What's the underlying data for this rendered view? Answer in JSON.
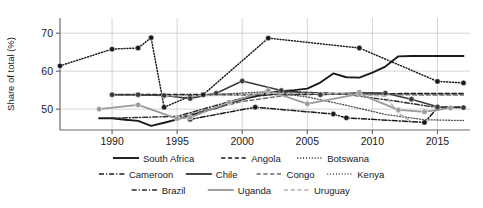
{
  "chart_data": {
    "type": "line",
    "title": "",
    "xlabel": "",
    "ylabel": "Share of total (%)",
    "xlim": [
      1986,
      2017.5
    ],
    "ylim": [
      44.5,
      74
    ],
    "xticks": [
      1990,
      1995,
      2000,
      2005,
      2010,
      2015
    ],
    "yticks": [
      50,
      60,
      70
    ],
    "xtick_labels": [
      "1990",
      "1995",
      "2000",
      "2005",
      "2010",
      "2015"
    ],
    "ytick_labels": [
      "70",
      "60",
      "50"
    ],
    "grid": "horizontal-and-vertical-light",
    "legend_position": "below-axes",
    "series": [
      {
        "name": "South Africa",
        "style": "solid",
        "color": "#1a1a1a",
        "width": 1.9,
        "markers": false,
        "x": [
          1989,
          1990,
          1991,
          1992,
          1993,
          1994,
          1995,
          1996,
          1997,
          1998,
          1999,
          2000,
          2001,
          2002,
          2003,
          2004,
          2005,
          2006,
          2007,
          2008,
          2009,
          2010,
          2011,
          2012,
          2013,
          2014,
          2015,
          2016,
          2017
        ],
        "values": [
          47.6,
          47.6,
          47.2,
          46.9,
          45.6,
          46.4,
          47.3,
          48.3,
          49.4,
          50.3,
          51.5,
          52.6,
          53.4,
          54.3,
          54.7,
          55.0,
          55.4,
          57.0,
          59.4,
          58.4,
          58.3,
          59.6,
          61.2,
          63.9,
          64.0,
          64.0,
          64.0,
          64.0,
          64.0
        ]
      },
      {
        "name": "Angola",
        "style": "dashed",
        "color": "#1a1a1a",
        "width": 1.7,
        "markers": false,
        "x": [
          1990,
          1995,
          2000,
          2005,
          2010,
          2014,
          2017
        ],
        "values": [
          53.8,
          53.8,
          53.8,
          53.9,
          54.0,
          54.1,
          54.1
        ]
      },
      {
        "name": "Botswana",
        "style": "dotted",
        "color": "#1a1a1a",
        "width": 1.5,
        "markers": true,
        "x": [
          1986,
          1990,
          1992,
          1993,
          1994,
          1996,
          1997,
          2002,
          2009,
          2015,
          2017
        ],
        "values": [
          61.4,
          65.8,
          66.1,
          68.8,
          50.5,
          53.4,
          53.8,
          68.7,
          66.1,
          57.3,
          56.9
        ]
      },
      {
        "name": "Cameroon",
        "style": "dashdot",
        "color": "#1a1a1a",
        "width": 1.5,
        "markers": true,
        "x": [
          1996,
          2001,
          2007,
          2008,
          2014,
          2015
        ],
        "values": [
          47.3,
          50.5,
          48.7,
          47.7,
          46.5,
          50.3
        ]
      },
      {
        "name": "Chile",
        "style": "solid",
        "color": "#3a3a3a",
        "width": 1.6,
        "markers": true,
        "x": [
          1990,
          1992,
          1994,
          1996,
          1998,
          2000,
          2003,
          2006,
          2009,
          2011,
          2013,
          2015,
          2017
        ],
        "values": [
          53.8,
          53.8,
          53.6,
          52.8,
          54.2,
          57.4,
          54.9,
          53.8,
          54.3,
          54.2,
          52.6,
          50.6,
          50.4
        ]
      },
      {
        "name": "Congo",
        "style": "dashed",
        "color": "#6a6a6a",
        "width": 1.4,
        "markers": false,
        "x": [
          1995,
          2000,
          2005,
          2010,
          2014,
          2017
        ],
        "values": [
          47.8,
          52.0,
          54.4,
          53.9,
          53.7,
          53.7
        ]
      },
      {
        "name": "Kenya",
        "style": "dotted",
        "color": "#4a4a4a",
        "width": 1.3,
        "markers": false,
        "x": [
          1992,
          1997,
          2002,
          2005,
          2008,
          2011,
          2014,
          2017
        ],
        "values": [
          53.6,
          53.7,
          54.6,
          53.2,
          51.0,
          48.6,
          47.2,
          47.0
        ]
      },
      {
        "name": "Brazil",
        "style": "dashdot",
        "color": "#2a2a2a",
        "width": 1.4,
        "markers": false,
        "x": [
          1990,
          1995,
          2000,
          2004,
          2008,
          2012,
          2015,
          2017
        ],
        "values": [
          47.6,
          48.1,
          52.9,
          54.6,
          53.9,
          52.0,
          50.4,
          50.6
        ]
      },
      {
        "name": "Uganda",
        "style": "solid",
        "color": "#9a9a9a",
        "width": 1.8,
        "markers": true,
        "x": [
          1989,
          1992,
          1995,
          1996,
          1999,
          2002,
          2005,
          2009,
          2012,
          2014,
          2016
        ],
        "values": [
          50.0,
          51.1,
          47.5,
          47.8,
          51.8,
          54.9,
          51.4,
          54.0,
          49.8,
          49.3,
          50.3
        ]
      },
      {
        "name": "Uruguay",
        "style": "dashed",
        "color": "#b0b0b0",
        "width": 1.4,
        "markers": false,
        "x": [
          1994,
          1998,
          2003,
          2008,
          2011,
          2012,
          2013
        ],
        "values": [
          53.5,
          53.6,
          54.2,
          54.0,
          53.4,
          49.0,
          46.6
        ]
      }
    ]
  },
  "axes": {
    "ylabel": "Share of total (%)",
    "ytick_labels": [
      "70",
      "60",
      "50"
    ],
    "xtick_labels": [
      "1990",
      "1995",
      "2000",
      "2005",
      "2010",
      "2015"
    ]
  },
  "legend": {
    "rows": [
      [
        {
          "label": "South Africa",
          "style": "solid",
          "color": "#1a1a1a"
        },
        {
          "label": "Angola",
          "style": "dashed",
          "color": "#1a1a1a"
        },
        {
          "label": "Botswana",
          "style": "dotted",
          "color": "#1a1a1a"
        }
      ],
      [
        {
          "label": "Cameroon",
          "style": "dashdot",
          "color": "#1a1a1a"
        },
        {
          "label": "Chile",
          "style": "solid",
          "color": "#3a3a3a"
        },
        {
          "label": "Congo",
          "style": "dashed",
          "color": "#6a6a6a"
        },
        {
          "label": "Kenya",
          "style": "dotted",
          "color": "#4a4a4a"
        }
      ],
      [
        {
          "label": "Brazil",
          "style": "dashdot",
          "color": "#2a2a2a"
        },
        {
          "label": "Uganda",
          "style": "solid",
          "color": "#9a9a9a"
        },
        {
          "label": "Uruguay",
          "style": "dashed",
          "color": "#b0b0b0"
        }
      ]
    ]
  },
  "colors": {
    "background": "#ffffff",
    "axis": "#6b6b6b",
    "grid": "#c9c9c9",
    "text": "#1a1a1a"
  }
}
